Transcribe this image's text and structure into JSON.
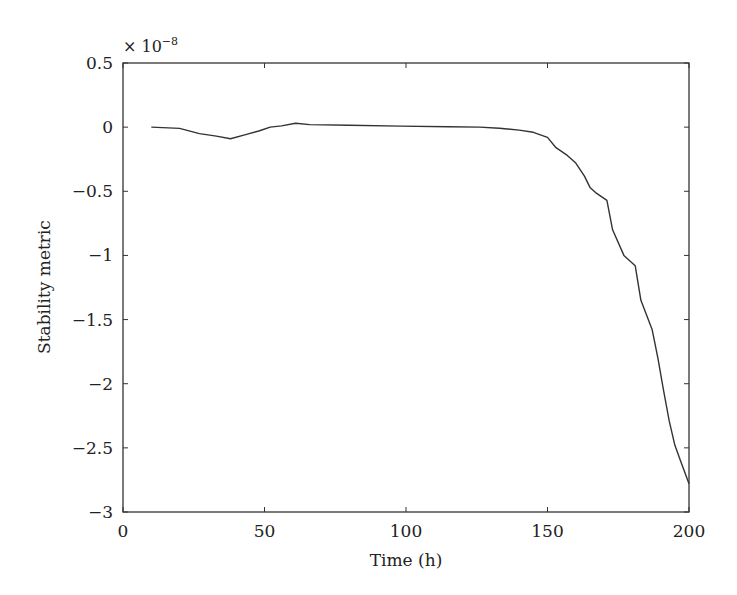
{
  "chart_data": {
    "type": "line",
    "title": "",
    "xlabel": "Time (h)",
    "ylabel": "Stability metric",
    "y_multiplier": "× 10−8",
    "y_multiplier_base": "× 10",
    "y_multiplier_exp": "−8",
    "xlim": [
      0,
      200
    ],
    "ylim": [
      -3,
      0.5
    ],
    "grid": false,
    "legend": null,
    "x_ticks": [
      0,
      50,
      100,
      150,
      200
    ],
    "x_tick_labels": [
      "0",
      "50",
      "100",
      "150",
      "200"
    ],
    "y_ticks": [
      0.5,
      0,
      -0.5,
      -1,
      -1.5,
      -2,
      -2.5,
      -3
    ],
    "y_tick_labels": [
      "0.5",
      "0",
      "−0.5",
      "−1",
      "−1.5",
      "−2",
      "−2.5",
      "−3"
    ],
    "series": [
      {
        "name": "Stability metric",
        "color": "#333333",
        "x": [
          10,
          20,
          27,
          33,
          38,
          43,
          48,
          52,
          56,
          61,
          66,
          80,
          98,
          115,
          126,
          133,
          140,
          145,
          150,
          153,
          157,
          160,
          163,
          165,
          167,
          171,
          173,
          177,
          181,
          183,
          187,
          189,
          191,
          193,
          195,
          197,
          200
        ],
        "values": [
          0.0,
          -0.01,
          -0.05,
          -0.07,
          -0.09,
          -0.06,
          -0.03,
          0.0,
          0.01,
          0.03,
          0.02,
          0.015,
          0.008,
          0.003,
          0.0,
          -0.008,
          -0.023,
          -0.04,
          -0.08,
          -0.16,
          -0.22,
          -0.28,
          -0.38,
          -0.47,
          -0.51,
          -0.57,
          -0.8,
          -1.0,
          -1.08,
          -1.35,
          -1.58,
          -1.8,
          -2.05,
          -2.29,
          -2.48,
          -2.6,
          -2.78
        ]
      }
    ]
  }
}
